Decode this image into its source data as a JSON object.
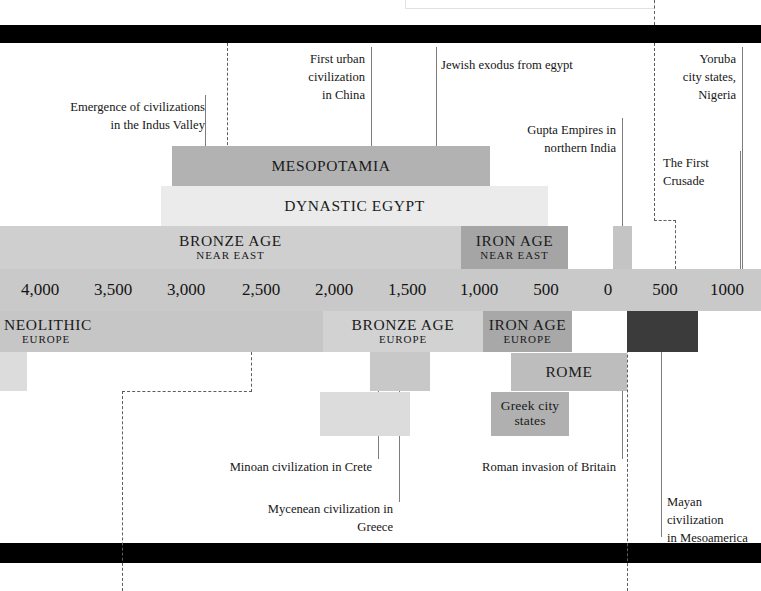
{
  "page": {
    "width": 761,
    "height": 591
  },
  "colors": {
    "band": "#000000",
    "scale_strip": "#c9c9c9",
    "mesopotamia": "#b2b2b2",
    "dynastic_egypt": "#ebebeb",
    "bronze_age_near_east": "#cfcfcf",
    "iron_age_near_east": "#a5a5a5",
    "gupta": "#c4c4c4",
    "neolithic_europe": "#c6c6c6",
    "bronze_age_europe": "#d2d2d2",
    "iron_age_europe": "#a8a8a8",
    "mayan": "#3b3b3b",
    "rome": "#bdbdbd",
    "greek": "#b0b0b0",
    "minoan": "#dcdcdc",
    "mycenean": "#c8c8c8",
    "leader_line": "#7d7d7d",
    "dashed_line": "#5d5d5d"
  },
  "scale": {
    "label": "Timeline scale (BCE to CE)",
    "ticks": [
      {
        "label": "4,000",
        "x": 40
      },
      {
        "label": "3,500",
        "x": 113
      },
      {
        "label": "3,000",
        "x": 186
      },
      {
        "label": "2,500",
        "x": 261
      },
      {
        "label": "2,000",
        "x": 334
      },
      {
        "label": "1,500",
        "x": 407
      },
      {
        "label": "1,000",
        "x": 479
      },
      {
        "label": "500",
        "x": 546
      },
      {
        "label": "0",
        "x": 608
      },
      {
        "label": "500",
        "x": 665
      },
      {
        "label": "1000",
        "x": 727
      }
    ]
  },
  "bars": {
    "upper": [
      {
        "name": "mesopotamia",
        "title": "MESOPOTAMIA",
        "subtitle": "",
        "x": 172,
        "y": 146,
        "w": 318,
        "h": 40,
        "color": "#b2b2b2",
        "dark": false
      },
      {
        "name": "dynastic-egypt",
        "title": "DYNASTIC EGYPT",
        "subtitle": "",
        "x": 161,
        "y": 186,
        "w": 387,
        "h": 40,
        "color": "#ebebeb",
        "dark": false
      },
      {
        "name": "bronze-age-near-east",
        "title": "BRONZE AGE",
        "subtitle": "NEAR EAST",
        "x": 0,
        "y": 226,
        "w": 461,
        "h": 43,
        "color": "#cfcfcf",
        "dark": false
      },
      {
        "name": "iron-age-near-east",
        "title": "IRON AGE",
        "subtitle": "NEAR EAST",
        "x": 461,
        "y": 226,
        "w": 107,
        "h": 43,
        "color": "#a5a5a5",
        "dark": false
      },
      {
        "name": "gupta-empires-bar",
        "title": "",
        "subtitle": "",
        "x": 613,
        "y": 226,
        "w": 19,
        "h": 43,
        "color": "#c4c4c4",
        "dark": false
      }
    ],
    "lower": [
      {
        "name": "neolithic-europe",
        "title": "NEOLITHIC",
        "subtitle": "EUROPE",
        "x": 0,
        "y": 311,
        "w": 323,
        "h": 41,
        "color": "#c6c6c6",
        "dark": false,
        "align": "left"
      },
      {
        "name": "bronze-age-europe",
        "title": "BRONZE AGE",
        "subtitle": "EUROPE",
        "x": 323,
        "y": 311,
        "w": 160,
        "h": 41,
        "color": "#d2d2d2",
        "dark": false
      },
      {
        "name": "iron-age-europe",
        "title": "IRON AGE",
        "subtitle": "EUROPE",
        "x": 483,
        "y": 311,
        "w": 89,
        "h": 41,
        "color": "#a8a8a8",
        "dark": false
      },
      {
        "name": "mayan-civilization-bar",
        "title": "",
        "subtitle": "",
        "x": 627,
        "y": 311,
        "w": 71,
        "h": 41,
        "color": "#3b3b3b",
        "dark": true
      },
      {
        "name": "neolithic-tail-bar",
        "title": "",
        "subtitle": "",
        "x": 0,
        "y": 352,
        "w": 27,
        "h": 39,
        "color": "#dcdcdc",
        "dark": false
      },
      {
        "name": "mycenean-bar",
        "title": "",
        "subtitle": "",
        "x": 370,
        "y": 352,
        "w": 60,
        "h": 39,
        "color": "#c8c8c8",
        "dark": false
      },
      {
        "name": "rome",
        "title": "ROME",
        "subtitle": "",
        "x": 511,
        "y": 353,
        "w": 116,
        "h": 38,
        "color": "#bdbdbd",
        "dark": false
      },
      {
        "name": "minoan-bar",
        "title": "",
        "subtitle": "",
        "x": 320,
        "y": 392,
        "w": 90,
        "h": 44,
        "color": "#dcdcdc",
        "dark": false
      },
      {
        "name": "greek-city-states",
        "title": "Greek city\nstates",
        "subtitle": "",
        "x": 491,
        "y": 392,
        "w": 78,
        "h": 44,
        "color": "#b0b0b0",
        "dark": false,
        "small": true
      }
    ]
  },
  "annotations": {
    "top": [
      {
        "name": "annotation-indus-valley",
        "text": "Emergence of civilizations\nin the Indus Valley",
        "align": "right",
        "x": 60,
        "y": 99,
        "w": 145
      },
      {
        "name": "annotation-first-urban-china",
        "text": "First urban\ncivilization\nin China",
        "align": "right",
        "x": 285,
        "y": 51,
        "w": 80
      },
      {
        "name": "annotation-jewish-exodus",
        "text": "Jewish exodus from egypt",
        "align": "left",
        "x": 441,
        "y": 57,
        "w": 180
      },
      {
        "name": "annotation-gupta-empires",
        "text": "Gupta Empires in\nnorthern India",
        "align": "right",
        "x": 500,
        "y": 122,
        "w": 110
      },
      {
        "name": "annotation-yoruba-city-states",
        "text": "Yoruba\ncity states,\nNigeria",
        "align": "right",
        "x": 672,
        "y": 51,
        "w": 66
      },
      {
        "name": "annotation-first-crusade",
        "text": "The First\nCrusade",
        "align": "left",
        "x": 662,
        "y": 155,
        "w": 74
      }
    ],
    "bottom": [
      {
        "name": "annotation-minoan-crete",
        "text": "Minoan civilization in Crete",
        "align": "right",
        "x": 228,
        "y": 459,
        "w": 145
      },
      {
        "name": "annotation-mycenean-greece",
        "text": "Mycenean civilization in Greece",
        "align": "right",
        "x": 232,
        "y": 501,
        "w": 163
      },
      {
        "name": "annotation-roman-invasion-britain",
        "text": "Roman invasion of Britain",
        "align": "right",
        "x": 481,
        "y": 459,
        "w": 135
      },
      {
        "name": "annotation-mayan-mesoamerica",
        "text": "Mayan civilization\nin Mesoamerica",
        "align": "left",
        "x": 667,
        "y": 494,
        "w": 94
      }
    ]
  }
}
